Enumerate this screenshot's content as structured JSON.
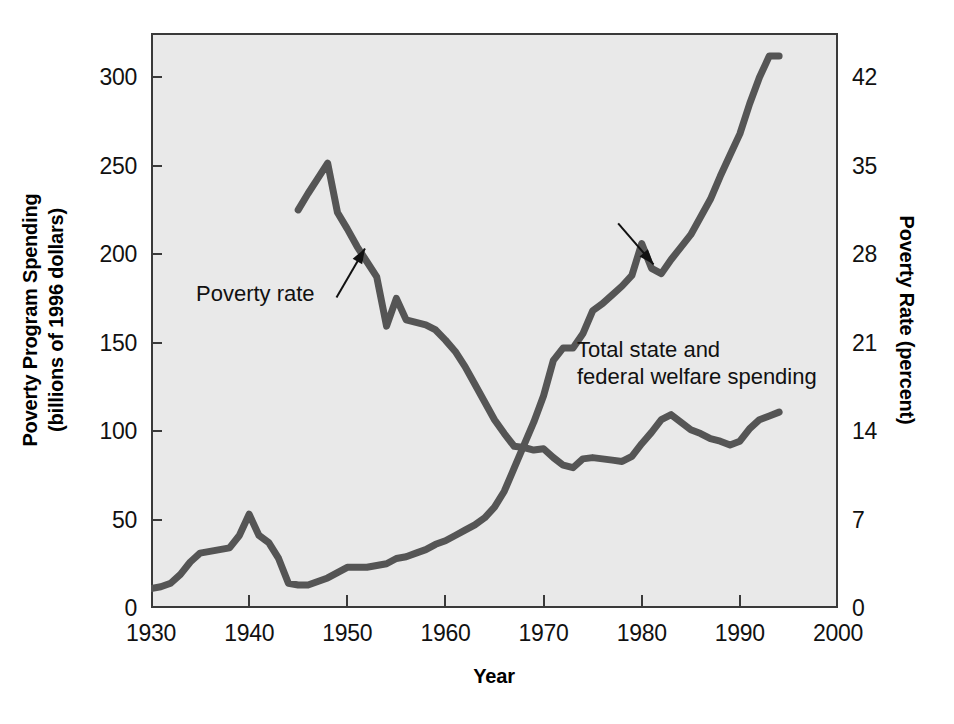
{
  "chart_data": {
    "type": "line",
    "title": "",
    "xlabel": "Year",
    "ylabel": "Poverty Program Spending (billions of 1996 dollars)",
    "ylabel_line1": "Poverty Program Spending",
    "ylabel_line2": "(billions of 1996 dollars)",
    "y2label": "Poverty Rate (percent)",
    "xlim": [
      1930,
      2000
    ],
    "ylim": [
      0,
      325
    ],
    "y2lim": [
      0,
      45.5
    ],
    "grid": false,
    "legend_position": "inline-annotations",
    "xticks": [
      1930,
      1940,
      1950,
      1960,
      1970,
      1980,
      1990,
      2000
    ],
    "xtick_labels": [
      "1930",
      "1940",
      "1950",
      "1960",
      "1970",
      "1980",
      "1990",
      "2000"
    ],
    "yticks": [
      0,
      50,
      100,
      150,
      200,
      250,
      300
    ],
    "ytick_labels": [
      "0",
      "50",
      "100",
      "150",
      "200",
      "250",
      "300"
    ],
    "y2ticks": [
      0,
      7,
      14,
      21,
      28,
      35,
      42
    ],
    "y2tick_labels": [
      "0",
      "7",
      "14",
      "21",
      "28",
      "35",
      "42"
    ],
    "series": [
      {
        "name": "Total state and federal welfare spending",
        "axis": "left",
        "units": "billions of 1996 dollars",
        "color": "#555555",
        "x": [
          1930,
          1931,
          1932,
          1933,
          1934,
          1935,
          1936,
          1937,
          1938,
          1939,
          1940,
          1941,
          1942,
          1943,
          1944,
          1945,
          1946,
          1947,
          1948,
          1949,
          1950,
          1951,
          1952,
          1953,
          1954,
          1955,
          1956,
          1957,
          1958,
          1959,
          1960,
          1961,
          1962,
          1963,
          1964,
          1965,
          1966,
          1967,
          1968,
          1969,
          1970,
          1971,
          1972,
          1973,
          1974,
          1975,
          1976,
          1977,
          1978,
          1979,
          1980,
          1981,
          1982,
          1983,
          1984,
          1985,
          1986,
          1987,
          1988,
          1989,
          1990,
          1991,
          1992,
          1993,
          1994
        ],
        "values": [
          11,
          12,
          14,
          19,
          26,
          31,
          32,
          33,
          34,
          41,
          53,
          41,
          37,
          28,
          14,
          13,
          13,
          15,
          17,
          20,
          23,
          23,
          23,
          24,
          25,
          28,
          29,
          31,
          33,
          36,
          38,
          41,
          44,
          47,
          51,
          57,
          66,
          79,
          92,
          105,
          120,
          140,
          147,
          147,
          155,
          168,
          172,
          177,
          182,
          188,
          206,
          192,
          189,
          197,
          204,
          211,
          221,
          231,
          244,
          256,
          268,
          285,
          300,
          312,
          312
        ]
      },
      {
        "name": "Poverty rate",
        "axis": "right",
        "units": "percent",
        "color": "#555555",
        "x": [
          1945,
          1946,
          1947,
          1948,
          1949,
          1950,
          1951,
          1952,
          1953,
          1954,
          1955,
          1956,
          1957,
          1958,
          1959,
          1960,
          1961,
          1962,
          1963,
          1964,
          1965,
          1966,
          1967,
          1968,
          1969,
          1970,
          1971,
          1972,
          1973,
          1974,
          1975,
          1976,
          1977,
          1978,
          1979,
          1980,
          1981,
          1982,
          1983,
          1984,
          1985,
          1986,
          1987,
          1988,
          1989,
          1990,
          1991,
          1992,
          1993,
          1994
        ],
        "values": [
          31.5,
          32.8,
          34.0,
          35.2,
          31.3,
          30.0,
          28.6,
          27.4,
          26.2,
          22.3,
          24.5,
          22.8,
          22.6,
          22.4,
          22.0,
          21.2,
          20.3,
          19.1,
          17.7,
          16.3,
          14.9,
          13.8,
          12.8,
          12.7,
          12.5,
          12.6,
          11.9,
          11.3,
          11.1,
          11.8,
          11.9,
          11.8,
          11.7,
          11.6,
          12.0,
          13.0,
          13.9,
          14.9,
          15.3,
          14.7,
          14.1,
          13.8,
          13.4,
          13.2,
          12.9,
          13.2,
          14.2,
          14.9,
          15.2,
          15.5
        ]
      }
    ],
    "annotations": [
      {
        "name": "poverty-rate",
        "text": "Poverty rate",
        "lines": [
          "Poverty rate"
        ],
        "target_x": 1951.8,
        "target_y_percent": 29.0
      },
      {
        "name": "total-welfare-spending",
        "text": "Total state and federal welfare spending",
        "lines": [
          "Total state and",
          "federal welfare spending"
        ],
        "target_x": 1981.2,
        "target_y_spending": 192
      }
    ]
  },
  "colors": {
    "line": "#555555",
    "plot_background": "#e9e9e9",
    "frame": "#3a3a3a",
    "page_background": "#ffffff",
    "text": "#111111"
  }
}
